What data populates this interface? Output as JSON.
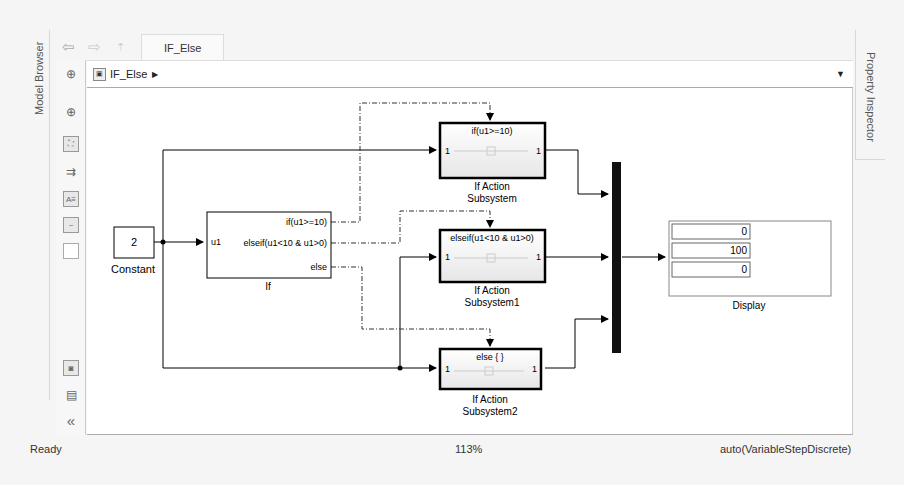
{
  "panels": {
    "left_tab": "Model Browser",
    "right_tab": "Property Inspector"
  },
  "toolbar": {
    "back_icon": "back-arrow-icon",
    "forward_icon": "forward-arrow-icon",
    "up_icon": "up-to-parent-icon",
    "tab_label": "IF_Else"
  },
  "breadcrumb": {
    "model_icon": "model-icon",
    "path": "IF_Else",
    "arrow": "▶",
    "dropdown": "▼"
  },
  "side_tools": [
    {
      "name": "hide-show-explorer-icon",
      "glyph": "⊕"
    },
    {
      "name": "zoom-icon",
      "glyph": "🔍"
    },
    {
      "name": "fit-to-view-icon",
      "glyph": "⛶"
    },
    {
      "name": "signal-flow-icon",
      "glyph": "⇉"
    },
    {
      "name": "annotation-icon",
      "glyph": "A≡"
    },
    {
      "name": "image-icon",
      "glyph": "▨"
    },
    {
      "name": "area-icon",
      "glyph": " "
    },
    {
      "name": "screenshot-icon",
      "glyph": "◙"
    },
    {
      "name": "report-icon",
      "glyph": "▤"
    },
    {
      "name": "collapse-icon",
      "glyph": "«"
    }
  ],
  "diagram": {
    "constant": {
      "value": "2",
      "label": "Constant"
    },
    "if_block": {
      "label": "If",
      "input_port": "u1",
      "outputs": [
        "if(u1>=10)",
        "elseif(u1<10 & u1>0)",
        "else"
      ]
    },
    "subsystems": [
      {
        "condition": "if(u1>=10)",
        "in_port": "1",
        "out_port": "1",
        "label_line1": "If Action",
        "label_line2": "Subsystem"
      },
      {
        "condition": "elseif(u1<10 & u1>0)",
        "in_port": "1",
        "out_port": "1",
        "label_line1": "If Action",
        "label_line2": "Subsystem1"
      },
      {
        "condition": "else { }",
        "in_port": "1",
        "out_port": "1",
        "label_line1": "If Action",
        "label_line2": "Subsystem2"
      }
    ],
    "display": {
      "label": "Display",
      "values": [
        "0",
        "100",
        "0"
      ]
    }
  },
  "status_bar": {
    "state": "Ready",
    "zoom": "113%",
    "solver": "auto(VariableStepDiscrete)"
  }
}
